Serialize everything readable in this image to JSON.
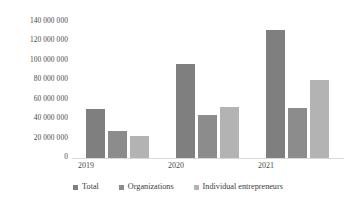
{
  "chart_data": {
    "type": "bar",
    "title": "",
    "xlabel": "",
    "ylabel": "",
    "categories": [
      "2019",
      "2020",
      "2021"
    ],
    "series": [
      {
        "name": "Total",
        "color": "#7f7f7f",
        "values": [
          47000000,
          90000000,
          123000000
        ]
      },
      {
        "name": "Organizations",
        "color": "#8c8c8c",
        "values": [
          26000000,
          41000000,
          48000000
        ]
      },
      {
        "name": "Individual entrepreneurs",
        "color": "#b3b3b3",
        "values": [
          21000000,
          49000000,
          75000000
        ]
      }
    ],
    "ylim": [
      0,
      140000000
    ],
    "ytick_values": [
      0,
      20000000,
      40000000,
      60000000,
      80000000,
      100000000,
      120000000,
      140000000
    ],
    "ytick_labels": [
      "0",
      "20 000 000",
      "40 000 000",
      "60 000 000",
      "80 000 000",
      "100 000 000",
      "120 000 000",
      "140 000 000"
    ],
    "grid": false,
    "legend_position": "bottom"
  },
  "axis": {
    "ticks": [
      {
        "label": "140 000 000"
      },
      {
        "label": "120 000 000"
      },
      {
        "label": "100 000 000"
      },
      {
        "label": "80 000 000"
      },
      {
        "label": "60 000 000"
      },
      {
        "label": "40 000 000"
      },
      {
        "label": "20 000 000"
      },
      {
        "label": "0"
      }
    ]
  },
  "legend": {
    "items": [
      {
        "label": "Total"
      },
      {
        "label": "Organizations"
      },
      {
        "label": "Individual entrepreneurs"
      }
    ]
  }
}
